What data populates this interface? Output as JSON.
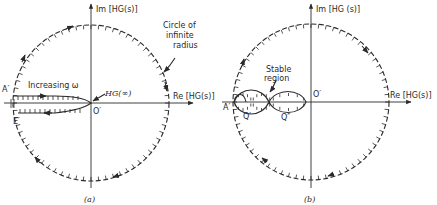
{
  "figure": {
    "panels": [
      {
        "id": "a",
        "caption": "(a)",
        "im_axis_label": "Im [HG(s)]",
        "re_axis_label": "Re [HG(s)]",
        "origin_label": "O′",
        "point_A_label": "A′",
        "point_E_label": "E′",
        "hg_inf_label": "HG(∞)",
        "increasing_label": "Increasing ω",
        "circle_note": [
          "Circle of",
          "infinite",
          "radius"
        ]
      },
      {
        "id": "b",
        "caption": "(b)",
        "im_axis_label": "Im [HG (s)]",
        "re_axis_label": "Re [HG(s)]",
        "origin_label": "O′",
        "point_A_label": "A′",
        "point_Q_label": "Q′",
        "point_Q2_label": "Q″",
        "stable_note": [
          "Stable",
          "region"
        ]
      }
    ]
  }
}
